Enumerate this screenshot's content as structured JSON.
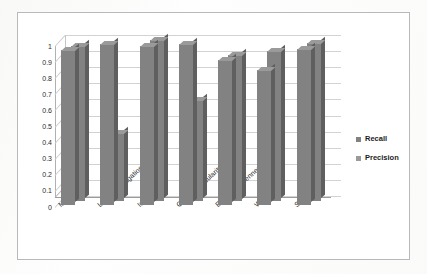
{
  "chart_data": {
    "type": "bar",
    "title": "",
    "subtitle": "",
    "xlabel": "",
    "ylabel": "",
    "ylim": [
      0,
      1
    ],
    "yticks": [
      "1",
      "0.9",
      "0.8",
      "0.7",
      "0.6",
      "0.5",
      "0.4",
      "0.3",
      "0.2",
      "0.1",
      "0"
    ],
    "ytick_values": [
      1,
      0.9,
      0.8,
      0.7,
      0.6,
      0.5,
      0.4,
      0.3,
      0.2,
      0.1,
      0
    ],
    "grid": true,
    "legend_position": "right",
    "three_d": true,
    "categories": [
      "Multilevel",
      "Label Propagation",
      "Infomap",
      "Greedy Modularity",
      "Edge Betweenness",
      "Walktrap",
      "Spinglass"
    ],
    "series": [
      {
        "name": "Recall",
        "color": "#828282",
        "values": [
          0.96,
          1.0,
          0.99,
          1.0,
          0.9,
          0.84,
          0.97
        ]
      },
      {
        "name": "Precision",
        "color": "#828282",
        "values": [
          0.96,
          0.42,
          1.0,
          0.63,
          0.91,
          0.93,
          0.98
        ]
      }
    ]
  },
  "legend": {
    "items": [
      {
        "label": "Recall",
        "color": "#828282"
      },
      {
        "label": "Precision",
        "color": "#9a9a9a"
      }
    ]
  }
}
